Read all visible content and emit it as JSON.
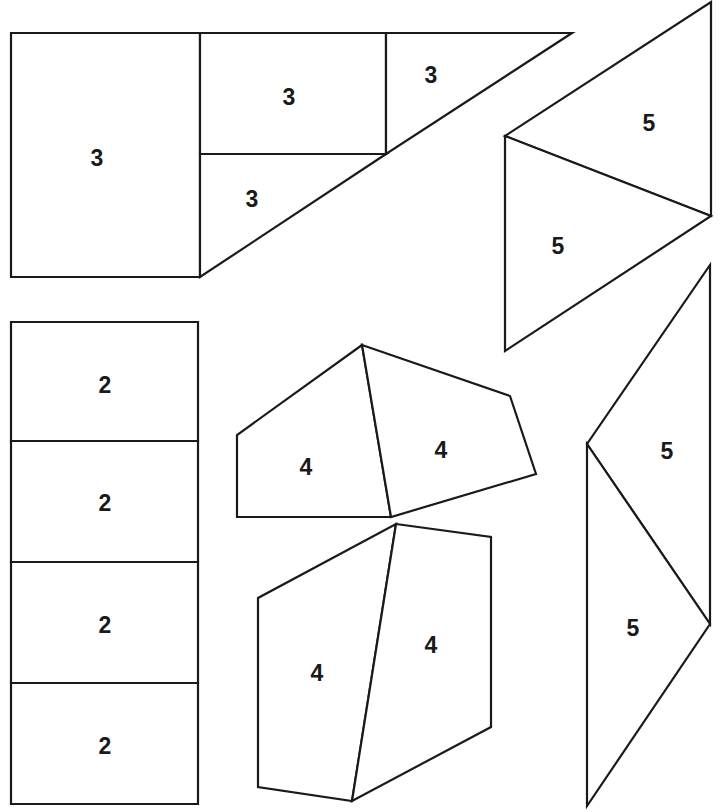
{
  "diagram": {
    "type": "tangram-puzzle-pieces",
    "stroke_color": "#1a1a1a",
    "fill_color": "#ffffff",
    "groups": [
      {
        "id": "group-3",
        "pieces": [
          {
            "id": "p3a",
            "label": "3",
            "points": "11,33 200,33 200,277 11,277",
            "label_pos": [
              97,
              158
            ]
          },
          {
            "id": "p3b",
            "label": "3",
            "points": "200,33 386,33 386,154 200,154",
            "label_pos": [
              289,
              97
            ]
          },
          {
            "id": "p3c",
            "label": "3",
            "points": "386,33 572,33 386,154",
            "label_pos": [
              431,
              75
            ]
          },
          {
            "id": "p3d",
            "label": "3",
            "points": "200,154 386,154 200,277",
            "label_pos": [
              252,
              199
            ]
          }
        ]
      },
      {
        "id": "group-5-top",
        "pieces": [
          {
            "id": "p5a",
            "label": "5",
            "points": "711,2 711,216 505,136",
            "label_pos": [
              649,
              123
            ]
          },
          {
            "id": "p5b",
            "label": "5",
            "points": "505,136 711,216 505,351",
            "label_pos": [
              558,
              246
            ]
          }
        ]
      },
      {
        "id": "group-2",
        "pieces": [
          {
            "id": "p2a",
            "label": "2",
            "points": "11,322 198,322 198,441 11,441",
            "label_pos": [
              105,
              385
            ]
          },
          {
            "id": "p2b",
            "label": "2",
            "points": "11,441 198,441 198,562 11,562",
            "label_pos": [
              105,
              503
            ]
          },
          {
            "id": "p2c",
            "label": "2",
            "points": "11,562 198,562 198,683 11,683",
            "label_pos": [
              105,
              625
            ]
          },
          {
            "id": "p2d",
            "label": "2",
            "points": "11,683 198,683 198,804 11,804",
            "label_pos": [
              105,
              746
            ]
          }
        ]
      },
      {
        "id": "group-4-top",
        "pieces": [
          {
            "id": "p4a",
            "label": "4",
            "points": "362,345 391,517 237,517 237,435",
            "label_pos": [
              306,
              467
            ]
          },
          {
            "id": "p4b",
            "label": "4",
            "points": "362,345 510,396 536,474 391,517",
            "label_pos": [
              441,
              450
            ]
          }
        ]
      },
      {
        "id": "group-4-bottom",
        "pieces": [
          {
            "id": "p4c",
            "label": "4",
            "points": "396,524 352,801 258,787 258,598",
            "label_pos": [
              317,
              673
            ]
          },
          {
            "id": "p4d",
            "label": "4",
            "points": "396,524 491,537 491,727 352,801",
            "label_pos": [
              431,
              645
            ]
          }
        ]
      },
      {
        "id": "group-5-bottom",
        "pieces": [
          {
            "id": "p5c",
            "label": "5",
            "points": "710,265 710,624 587,444",
            "label_pos": [
              667,
              451
            ]
          },
          {
            "id": "p5d",
            "label": "5",
            "points": "587,444 710,624 587,806",
            "label_pos": [
              633,
              628
            ]
          }
        ]
      }
    ]
  }
}
